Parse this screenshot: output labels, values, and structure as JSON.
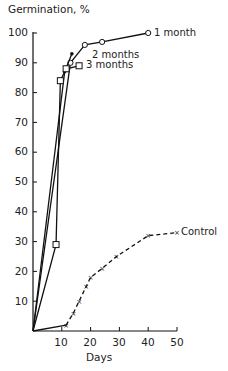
{
  "chart_data": {
    "type": "line",
    "title": "",
    "ylabel": "Germination, %",
    "xlabel": "Days",
    "xlim": [
      0,
      50
    ],
    "ylim": [
      0,
      100
    ],
    "xticks": [
      10,
      20,
      30,
      40,
      50
    ],
    "yticks": [
      10,
      20,
      30,
      40,
      50,
      60,
      70,
      80,
      90,
      100
    ],
    "grid": false,
    "legend_position": "inline labels at line ends",
    "series": [
      {
        "name": "1 month",
        "marker": "open-circle",
        "x": [
          0,
          13,
          18,
          24,
          40
        ],
        "y": [
          0,
          90,
          96,
          97,
          100
        ]
      },
      {
        "name": "2 months",
        "marker": "filled-circle",
        "x": [
          0,
          11,
          13.5
        ],
        "y": [
          0,
          87,
          93
        ]
      },
      {
        "name": "3 months",
        "marker": "open-square",
        "x": [
          0,
          8,
          9.5,
          11.5,
          16
        ],
        "y": [
          0,
          29,
          84,
          88,
          89
        ]
      },
      {
        "name": "Control",
        "marker": "cross",
        "x": [
          0,
          11.5,
          14,
          16,
          18.5,
          20,
          24,
          29,
          40,
          50
        ],
        "y": [
          0,
          2,
          6,
          10,
          15,
          18,
          21,
          25,
          32,
          33
        ]
      }
    ],
    "annotations": [
      "1 month",
      "2 months",
      "3 months",
      "Control"
    ]
  },
  "labels": {
    "ylabel": "Germination, %",
    "xlabel": "Days",
    "series_1": "1 month",
    "series_2": "2 months",
    "series_3": "3 months",
    "series_4": "Control",
    "yticks": [
      "100",
      "90",
      "80",
      "70",
      "60",
      "50",
      "40",
      "30",
      "20",
      "10"
    ],
    "xticks": [
      "10",
      "20",
      "30",
      "40",
      "50"
    ]
  },
  "colors": {
    "line": "#111111",
    "text": "#222222",
    "background": "#ffffff"
  }
}
